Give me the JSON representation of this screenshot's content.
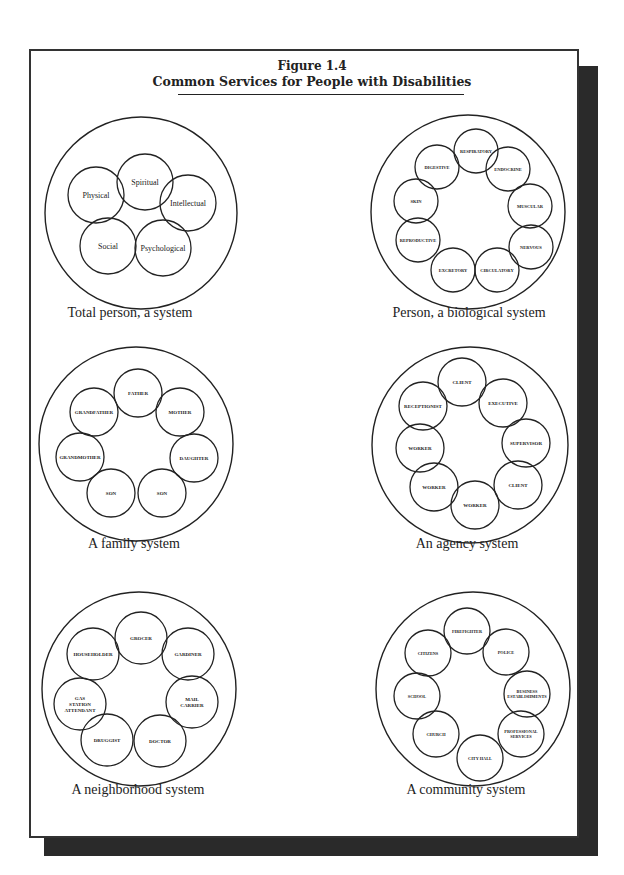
{
  "figure": {
    "number": "Figure 1.4",
    "title": "Common Services for People with Disabilities"
  },
  "diagrams": [
    {
      "caption": "Total person, a system",
      "outer": {
        "cx": 141,
        "cy": 213,
        "r": 96
      },
      "inner_r": 28,
      "label_size": 8,
      "items": [
        {
          "label": "Spiritual",
          "cx": 145,
          "cy": 182
        },
        {
          "label": "Intellectual",
          "cx": 188,
          "cy": 203
        },
        {
          "label": "Psychological",
          "cx": 163,
          "cy": 248
        },
        {
          "label": "Social",
          "cx": 108,
          "cy": 246
        },
        {
          "label": "Physical",
          "cx": 96,
          "cy": 195
        }
      ],
      "caption_pos": {
        "x": 130,
        "y": 314
      }
    },
    {
      "caption": "Person, a biological system",
      "outer": {
        "cx": 468,
        "cy": 212,
        "r": 97
      },
      "inner_r": 22,
      "label_size": 4.5,
      "items": [
        {
          "label": "RESPIRATORY",
          "cx": 476,
          "cy": 151
        },
        {
          "label": "ENDOCRINE",
          "cx": 508,
          "cy": 169
        },
        {
          "label": "MUSCULAR",
          "cx": 530,
          "cy": 206
        },
        {
          "label": "NERVOUS",
          "cx": 531,
          "cy": 247
        },
        {
          "label": "CIRCULATORY",
          "cx": 497,
          "cy": 270
        },
        {
          "label": "EXCRETORY",
          "cx": 453,
          "cy": 270
        },
        {
          "label": "REPRODUCTIVE",
          "cx": 418,
          "cy": 240
        },
        {
          "label": "SKIN",
          "cx": 416,
          "cy": 201
        },
        {
          "label": "DIGESTIVE",
          "cx": 437,
          "cy": 167
        }
      ],
      "caption_pos": {
        "x": 469,
        "y": 314
      }
    },
    {
      "caption": "A family system",
      "outer": {
        "cx": 136,
        "cy": 444,
        "r": 97
      },
      "inner_r": 24,
      "label_size": 5,
      "items": [
        {
          "label": "FATHER",
          "cx": 138,
          "cy": 393
        },
        {
          "label": "MOTHER",
          "cx": 180,
          "cy": 412
        },
        {
          "label": "DAUGHTER",
          "cx": 194,
          "cy": 458
        },
        {
          "label": "SON",
          "cx": 162,
          "cy": 493
        },
        {
          "label": "SON",
          "cx": 111,
          "cy": 493
        },
        {
          "label": "GRANDMOTHER",
          "cx": 80,
          "cy": 457
        },
        {
          "label": "GRANDFATHER",
          "cx": 94,
          "cy": 412
        }
      ],
      "caption_pos": {
        "x": 134,
        "y": 545
      }
    },
    {
      "caption": "An agency system",
      "outer": {
        "cx": 470,
        "cy": 445,
        "r": 98
      },
      "inner_r": 24,
      "label_size": 5,
      "items": [
        {
          "label": "CLIENT",
          "cx": 462,
          "cy": 382
        },
        {
          "label": "EXECUTIVE",
          "cx": 503,
          "cy": 403
        },
        {
          "label": "SUPERVISOR",
          "cx": 526,
          "cy": 443
        },
        {
          "label": "CLIENT",
          "cx": 518,
          "cy": 485
        },
        {
          "label": "WORKER",
          "cx": 475,
          "cy": 505
        },
        {
          "label": "WORKER",
          "cx": 434,
          "cy": 487
        },
        {
          "label": "WORKER",
          "cx": 420,
          "cy": 448
        },
        {
          "label": "RECEPTIONIST",
          "cx": 423,
          "cy": 406
        }
      ],
      "caption_pos": {
        "x": 467,
        "y": 545
      }
    },
    {
      "caption": "A neighborhood system",
      "outer": {
        "cx": 139,
        "cy": 689,
        "r": 97
      },
      "inner_r": 26,
      "label_size": 5,
      "items": [
        {
          "label": "GROCER",
          "cx": 141,
          "cy": 638,
          "lines": [
            "GROCER"
          ]
        },
        {
          "label": "GARDINER",
          "cx": 188,
          "cy": 654,
          "lines": [
            "GARDINER"
          ]
        },
        {
          "label": "MAIL CARRIER",
          "cx": 192,
          "cy": 702,
          "lines": [
            "MAIL",
            "CARRIER"
          ]
        },
        {
          "label": "DOCTOR",
          "cx": 160,
          "cy": 741,
          "lines": [
            "DOCTOR"
          ]
        },
        {
          "label": "DRUGGIST",
          "cx": 107,
          "cy": 740,
          "lines": [
            "DRUGGIST"
          ]
        },
        {
          "label": "GAS STATION ATTENDANT",
          "cx": 80,
          "cy": 704,
          "lines": [
            "GAS",
            "STATION",
            "ATTENDANT"
          ]
        },
        {
          "label": "HOUSEHOLDER",
          "cx": 93,
          "cy": 654,
          "lines": [
            "HOUSEHOLDER"
          ]
        }
      ],
      "caption_pos": {
        "x": 138,
        "y": 791
      }
    },
    {
      "caption": "A community system",
      "outer": {
        "cx": 473,
        "cy": 689,
        "r": 97
      },
      "inner_r": 23,
      "label_size": 4.3,
      "items": [
        {
          "label": "FIREFIGHTER",
          "cx": 467,
          "cy": 631,
          "lines": [
            "FIREFIGHTER"
          ]
        },
        {
          "label": "POLICE",
          "cx": 506,
          "cy": 652,
          "lines": [
            "POLICE"
          ]
        },
        {
          "label": "BUSINESS ESTABLISHMENTS",
          "cx": 527,
          "cy": 694,
          "lines": [
            "BUSINESS",
            "ESTABLISHMENTS"
          ]
        },
        {
          "label": "PROFESSIONAL SERVICES",
          "cx": 521,
          "cy": 734,
          "lines": [
            "PROFESSIONAL",
            "SERVICES"
          ]
        },
        {
          "label": "CITY HALL",
          "cx": 480,
          "cy": 758,
          "lines": [
            "CITY HALL"
          ]
        },
        {
          "label": "CHURCH",
          "cx": 436,
          "cy": 734,
          "lines": [
            "CHURCH"
          ]
        },
        {
          "label": "SCHOOL",
          "cx": 417,
          "cy": 696,
          "lines": [
            "SCHOOL"
          ]
        },
        {
          "label": "CITIZENS",
          "cx": 428,
          "cy": 653,
          "lines": [
            "CITIZENS"
          ]
        }
      ],
      "caption_pos": {
        "x": 466,
        "y": 791
      }
    }
  ],
  "colors": {
    "ink": "#222222",
    "frame_border": "#333333",
    "shadow": "#2a2a2a",
    "paper": "#ffffff"
  }
}
